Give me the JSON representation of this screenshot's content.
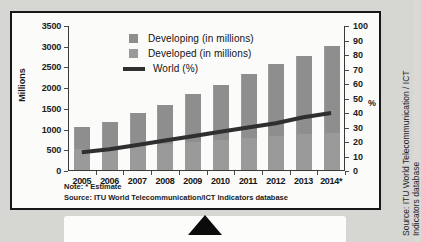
{
  "chart_data": {
    "type": "bar",
    "title": "",
    "categories": [
      "2005",
      "2006",
      "2007",
      "2008",
      "2009",
      "2010",
      "2011",
      "2012",
      "2013",
      "2014*"
    ],
    "series": [
      {
        "name": "Developing (in millions)",
        "type": "bar",
        "axis": "left",
        "color": "#8e8e8e",
        "values": [
          1030,
          1160,
          1370,
          1560,
          1830,
          2060,
          2320,
          2570,
          2760,
          3000
        ]
      },
      {
        "name": "Developed (in millions)",
        "type": "bar",
        "axis": "left",
        "color": "#9a9a9a",
        "values": [
          500,
          540,
          580,
          620,
          680,
          730,
          780,
          830,
          870,
          900
        ]
      },
      {
        "name": "World (%)",
        "type": "line",
        "axis": "right",
        "color": "#2f2f2f",
        "values": [
          13,
          15,
          18,
          21,
          24,
          27,
          30,
          33,
          37,
          40
        ]
      }
    ],
    "xlabel": "",
    "ylabel": "Millions",
    "ylabel_right": "%",
    "ylim": [
      0,
      3500
    ],
    "ylim_right": [
      0,
      100
    ],
    "yticks": [
      0,
      500,
      1000,
      1500,
      2000,
      2500,
      3000,
      3500
    ],
    "yticks_right": [
      0,
      10,
      20,
      30,
      40,
      50,
      60,
      70,
      80,
      90,
      100
    ],
    "grid": false,
    "legend_position": "top-left-inside"
  },
  "axes": {
    "left_label": "Millions",
    "right_label": "%",
    "left_ticks": [
      "3500",
      "3000",
      "2500",
      "2000",
      "1500",
      "1000",
      "500",
      "0"
    ],
    "right_ticks": [
      "100",
      "90",
      "80",
      "70",
      "60",
      "50",
      "40",
      "30",
      "20",
      "10",
      "0"
    ],
    "x_ticks": [
      "2005",
      "2006",
      "2007",
      "2008",
      "2009",
      "2010",
      "2011",
      "2012",
      "2013",
      "2014*"
    ]
  },
  "legend": {
    "items": [
      {
        "label": "Developing (in millions)",
        "marker": "square",
        "color": "#8e8e8e"
      },
      {
        "label": "Developed (in millions)",
        "marker": "square",
        "color": "#9a9a9a"
      },
      {
        "label": "World (%)",
        "marker": "line",
        "color": "#2f2f2f"
      }
    ]
  },
  "notes": {
    "note": "Note: * Estimate",
    "source": "Source: ITU World Telecommunication/ICT Indicators database"
  },
  "credit": {
    "line1": "Source: ITU World Telecommunication / ICT",
    "line2": "Indicators database"
  }
}
